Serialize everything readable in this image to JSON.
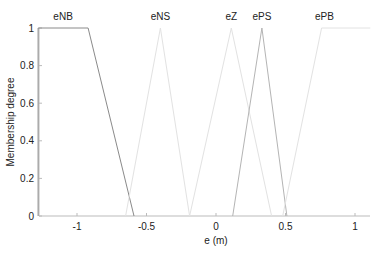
{
  "chart_data": {
    "type": "line",
    "title": "",
    "xlabel": "e (m)",
    "ylabel": "Membership degree",
    "xlim": [
      -1.28,
      1.11
    ],
    "ylim": [
      0,
      1
    ],
    "grid": false,
    "x_ticks": [
      -1,
      -0.5,
      0,
      0.5,
      1
    ],
    "x_tick_labels": [
      "-1",
      "-0.5",
      "0",
      "0.5",
      "1"
    ],
    "y_ticks": [
      0,
      0.2,
      0.4,
      0.6,
      0.8,
      1
    ],
    "y_tick_labels": [
      "0",
      "0.2",
      "0.4",
      "0.6",
      "0.8",
      "1"
    ],
    "series": [
      {
        "name": "eNB",
        "color": "#8a8a8a",
        "label_x": -1.1,
        "x": [
          -1.28,
          -1.28,
          -0.92,
          -0.59
        ],
        "y": [
          0,
          1,
          1,
          0
        ]
      },
      {
        "name": "eNS",
        "color": "#e2e2e2",
        "label_x": -0.4,
        "x": [
          -0.65,
          -0.4,
          -0.19
        ],
        "y": [
          0,
          1,
          0
        ]
      },
      {
        "name": "eZ",
        "color": "#e2e2e2",
        "label_x": 0.11,
        "x": [
          -0.19,
          0.11,
          0.4
        ],
        "y": [
          0,
          1,
          0
        ]
      },
      {
        "name": "ePS",
        "color": "#b4b4b4",
        "label_x": 0.33,
        "x": [
          0.12,
          0.33,
          0.51
        ],
        "y": [
          0,
          1,
          0
        ]
      },
      {
        "name": "ePB",
        "color": "#e2e2e2",
        "label_x": 0.78,
        "x": [
          0.48,
          0.76,
          1.11
        ],
        "y": [
          0,
          1,
          1
        ]
      }
    ]
  }
}
